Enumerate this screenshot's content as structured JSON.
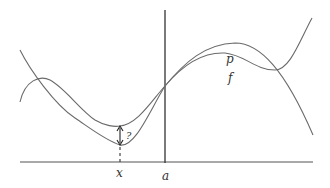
{
  "diagram": {
    "labels": {
      "p": "p",
      "f": "f",
      "x": "x",
      "a": "a",
      "question": "?"
    },
    "colors": {
      "curve": "#6a6a6a",
      "axis": "#555555",
      "vertical_line": "#333333"
    }
  }
}
